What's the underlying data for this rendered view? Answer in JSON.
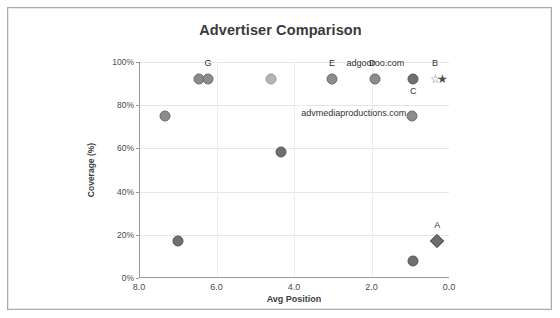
{
  "window": {
    "frame": true
  },
  "chart_data": {
    "type": "scatter",
    "title": "Advertiser Comparison",
    "xlabel": "Avg Position",
    "ylabel": "Coverage (%)",
    "xlim": [
      8.0,
      0.0
    ],
    "ylim": [
      0,
      100
    ],
    "x_reversed": true,
    "grid": true,
    "legend": "none",
    "xticks": [
      "8.0",
      "6.0",
      "4.0",
      "2.0",
      "0.0"
    ],
    "xtick_values": [
      8.0,
      6.0,
      4.0,
      2.0,
      0.0
    ],
    "yticks": [
      "0%",
      "20%",
      "40%",
      "60%",
      "80%",
      "100%"
    ],
    "ytick_values": [
      0,
      20,
      40,
      60,
      80,
      100
    ],
    "points": [
      {
        "label": "",
        "x": 6.45,
        "y": 92,
        "marker": "circle",
        "shade": "normal"
      },
      {
        "label": "G",
        "x": 6.22,
        "y": 92,
        "marker": "circle",
        "shade": "normal",
        "label_pos": "above"
      },
      {
        "label": "",
        "x": 4.6,
        "y": 92,
        "marker": "circle",
        "shade": "light"
      },
      {
        "label": "E",
        "x": 3.02,
        "y": 92,
        "marker": "circle",
        "shade": "normal",
        "label_pos": "above"
      },
      {
        "label": "D",
        "x": 1.9,
        "y": 92,
        "marker": "circle",
        "shade": "normal",
        "label_pos": "above"
      },
      {
        "label": "C",
        "x": 0.92,
        "y": 92,
        "marker": "circle",
        "shade": "dark",
        "label_pos": "below"
      },
      {
        "label": "adgooroo.com",
        "x": 1.9,
        "y": 92,
        "marker": "none",
        "label_pos": "above-right"
      },
      {
        "label": "B",
        "x": 0.36,
        "y": 92,
        "marker": "star-outline",
        "label_pos": "above"
      },
      {
        "label": "",
        "x": 0.17,
        "y": 92,
        "marker": "star-filled"
      },
      {
        "label": "",
        "x": 7.33,
        "y": 75,
        "marker": "circle",
        "shade": "normal"
      },
      {
        "label": "advmediaproductions.com",
        "x": 0.95,
        "y": 75,
        "marker": "circle",
        "shade": "normal",
        "label_pos": "left"
      },
      {
        "label": "",
        "x": 4.33,
        "y": 58.5,
        "marker": "circle",
        "shade": "dark"
      },
      {
        "label": "",
        "x": 7.0,
        "y": 17,
        "marker": "circle",
        "shade": "dark"
      },
      {
        "label": "A",
        "x": 0.3,
        "y": 17,
        "marker": "diamond",
        "label_pos": "above"
      },
      {
        "label": "",
        "x": 0.92,
        "y": 8,
        "marker": "circle",
        "shade": "dark"
      }
    ],
    "annotations": [
      {
        "text": "G",
        "x": 6.22,
        "y": 99
      },
      {
        "text": "E",
        "x": 3.02,
        "y": 99
      },
      {
        "text": "D",
        "x": 1.98,
        "y": 99
      },
      {
        "text": "adgooroo.com",
        "x": 1.9,
        "y": 99
      },
      {
        "text": "B",
        "x": 0.36,
        "y": 99
      },
      {
        "text": "C",
        "x": 0.92,
        "y": 86
      },
      {
        "text": "advmediaproductions.com",
        "x": 1.1,
        "y": 76
      },
      {
        "text": "A",
        "x": 0.3,
        "y": 24
      }
    ],
    "colors": {
      "marker_fill": "#8c8c8c",
      "marker_fill_light": "#b5b5b5",
      "marker_fill_dark": "#6f6f6f",
      "marker_stroke": "#6b6b6b",
      "grid": "#e6e6e6",
      "axis": "#9a9a9a",
      "text": "#333333",
      "title": "#3a3a3a",
      "background": "#ffffff"
    }
  }
}
